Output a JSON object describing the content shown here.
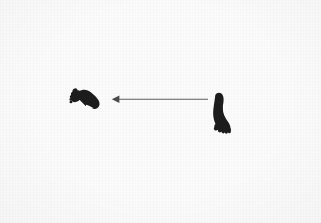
{
  "figure": {
    "width": 321,
    "height": 223,
    "background_color": "#fbfbfb",
    "ink_color": "#1c1c1c",
    "arrow_color": "#5e5e5e"
  },
  "elements": {
    "left_footprint": {
      "label": "left footprint",
      "orientation": "horizontal",
      "toe_position": "upper-left",
      "heel_position": "right",
      "color": "#1c1c1c",
      "bbox": [
        70,
        87,
        30,
        22
      ]
    },
    "right_footprint": {
      "label": "right footprint",
      "orientation": "vertical",
      "toe_position": "bottom",
      "heel_position": "top",
      "color": "#1c1c1c",
      "bbox": [
        209,
        92,
        25,
        42
      ]
    },
    "arrow": {
      "label": "direction arrow",
      "direction": "left",
      "color": "#5e5e5e",
      "start_x": 208,
      "end_x": 112,
      "y": 99,
      "head": "solid-triangle"
    }
  }
}
